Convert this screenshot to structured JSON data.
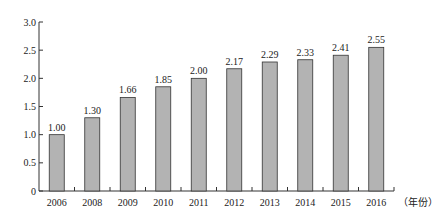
{
  "chart_data": {
    "type": "bar",
    "title": "",
    "xlabel": "（年份）",
    "ylabel": "",
    "ylim": [
      0,
      3.0
    ],
    "yticks": [
      "0",
      "0.5",
      "1.0",
      "1.5",
      "2.0",
      "2.5",
      "3.0"
    ],
    "grid": false,
    "legend": null,
    "categories": [
      "2006",
      "2008",
      "2009",
      "2010",
      "2011",
      "2012",
      "2013",
      "2014",
      "2015",
      "2016"
    ],
    "values": [
      1.0,
      1.3,
      1.66,
      1.85,
      2.0,
      2.17,
      2.29,
      2.33,
      2.41,
      2.55
    ],
    "value_labels": [
      "1.00",
      "1.30",
      "1.66",
      "1.85",
      "2.00",
      "2.17",
      "2.29",
      "2.33",
      "2.41",
      "2.55"
    ],
    "bar_color": "#b3b3b3"
  }
}
